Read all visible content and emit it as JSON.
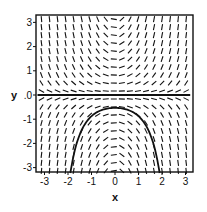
{
  "chart_data": {
    "type": "slope_field",
    "title": "",
    "xlabel": "x",
    "ylabel": "y",
    "xlim": [
      -3.3,
      3.2
    ],
    "ylim": [
      -3.3,
      3.3
    ],
    "x_ticks": [
      -3,
      -2,
      -1,
      0,
      1,
      2,
      3
    ],
    "x_tick_labels": [
      "-3",
      "-2",
      "-1",
      "0",
      "1",
      "2",
      "3"
    ],
    "y_ticks": [
      3,
      2,
      1,
      0,
      -1,
      -2,
      -3
    ],
    "y_tick_labels": [
      "3",
      "2",
      "1",
      ".0",
      "-1",
      "-2",
      "-3"
    ],
    "grid": false,
    "legend": null,
    "field": {
      "equation": "dy/dx = x*y",
      "columns": 19,
      "rows": 20,
      "segment_length": 6
    },
    "solution_curves": [
      {
        "name": "y = 0 (equilibrium)",
        "form": "y = 0",
        "x_range": [
          -3.3,
          3.2
        ]
      },
      {
        "name": "y = -0.53 e^(x^2/2)",
        "form": "y = C*exp(x^2/2)",
        "C": -0.53,
        "x_range": [
          -1.9,
          1.9
        ]
      }
    ],
    "colors": {
      "ink": "#111111",
      "background": "#ffffff"
    }
  }
}
